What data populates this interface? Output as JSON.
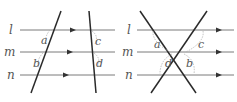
{
  "figures": [
    {
      "id": "parallel-transversals",
      "line_labels": [
        "l",
        "m",
        "n"
      ],
      "angle_labels": [
        "a",
        "b",
        "c",
        "d"
      ]
    },
    {
      "id": "crossing-transversals",
      "line_labels": [
        "l",
        "m",
        "n"
      ],
      "angle_labels": [
        "a",
        "c",
        "d",
        "b"
      ]
    }
  ],
  "colors": {
    "parallel_lines": "#7a7a7a",
    "transversals": "#2a2a2a",
    "labels": "#555555",
    "angle_arcs": "#b0b0b0"
  }
}
